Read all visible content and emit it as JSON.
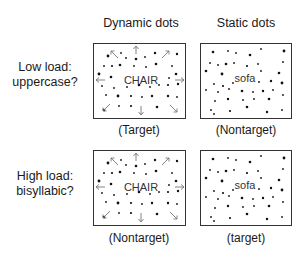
{
  "columns": [
    {
      "header": "Dynamic dots"
    },
    {
      "header": "Static dots"
    }
  ],
  "rows": [
    {
      "label_line1": "Low load:",
      "label_line2": "uppercase?",
      "panels": [
        {
          "word": "CHAIR",
          "caption": "(Target)",
          "type": "dynamic"
        },
        {
          "word": "sofa",
          "caption": "(Nontarget)",
          "type": "static"
        }
      ]
    },
    {
      "label_line1": "High load:",
      "label_line2": "bisyllabic?",
      "panels": [
        {
          "word": "CHAIR",
          "caption": "(Nontarget)",
          "type": "dynamic"
        },
        {
          "word": "sofa",
          "caption": "(target)",
          "type": "static"
        }
      ]
    }
  ],
  "icons": {
    "arrow": "outward-motion-arrow",
    "dot": "random-dot"
  }
}
